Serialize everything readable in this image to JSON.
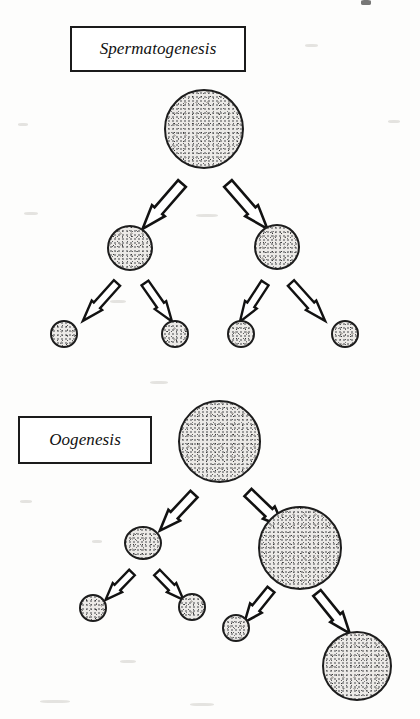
{
  "figure": {
    "background_color": "#fdfdfc",
    "ink_color": "#1d1d1d",
    "cell_fill_color": "#eceae7"
  },
  "panels": [
    {
      "id": "spermatogenesis",
      "label": "Spermatogenesis",
      "label_box": {
        "x": 70,
        "y": 26,
        "width": 176,
        "height": 46
      },
      "cells": [
        {
          "name": "primary-spermatocyte",
          "cx": 204,
          "cy": 129,
          "d": 80,
          "level": 0
        },
        {
          "name": "secondary-spermatocyte-left",
          "cx": 130,
          "cy": 248,
          "d": 46,
          "level": 1
        },
        {
          "name": "secondary-spermatocyte-right",
          "cx": 277,
          "cy": 247,
          "d": 46,
          "level": 1
        },
        {
          "name": "spermatid-1",
          "cx": 64,
          "cy": 334,
          "d": 28,
          "level": 2
        },
        {
          "name": "spermatid-2",
          "cx": 175,
          "cy": 334,
          "d": 28,
          "level": 2
        },
        {
          "name": "spermatid-3",
          "cx": 241,
          "cy": 334,
          "d": 28,
          "level": 2
        },
        {
          "name": "spermatid-4",
          "cx": 345,
          "cy": 334,
          "d": 28,
          "level": 2
        }
      ],
      "arrows": [
        {
          "name": "arrow-meiosis1-left",
          "x1": 182,
          "y1": 175,
          "x2": 143,
          "y2": 220,
          "w": 17
        },
        {
          "name": "arrow-meiosis1-right",
          "x1": 228,
          "y1": 175,
          "x2": 266,
          "y2": 220,
          "w": 17
        },
        {
          "name": "arrow-meiosis2-a",
          "x1": 117,
          "y1": 276,
          "x2": 83,
          "y2": 314,
          "w": 14
        },
        {
          "name": "arrow-meiosis2-b",
          "x1": 145,
          "y1": 276,
          "x2": 172,
          "y2": 314,
          "w": 14
        },
        {
          "name": "arrow-meiosis2-c",
          "x1": 265,
          "y1": 276,
          "x2": 240,
          "y2": 314,
          "w": 14
        },
        {
          "name": "arrow-meiosis2-d",
          "x1": 291,
          "y1": 276,
          "x2": 325,
          "y2": 314,
          "w": 14
        }
      ]
    },
    {
      "id": "oogenesis",
      "label": "Oogenesis",
      "label_box": {
        "x": 18,
        "y": 416,
        "width": 134,
        "height": 48
      },
      "cells": [
        {
          "name": "primary-oocyte",
          "cx": 220,
          "cy": 441,
          "d": 83,
          "level": 0
        },
        {
          "name": "first-polar-body",
          "cx": 143,
          "cy": 544,
          "d": 38,
          "level": 1
        },
        {
          "name": "secondary-oocyte",
          "cx": 300,
          "cy": 548,
          "d": 84,
          "level": 1
        },
        {
          "name": "polar-body-a",
          "cx": 93,
          "cy": 608,
          "d": 28,
          "level": 2
        },
        {
          "name": "polar-body-b",
          "cx": 192,
          "cy": 607,
          "d": 28,
          "level": 2
        },
        {
          "name": "polar-body-c",
          "cx": 236,
          "cy": 628,
          "d": 28,
          "level": 2
        },
        {
          "name": "ovum",
          "cx": 357,
          "cy": 666,
          "d": 70,
          "level": 2
        }
      ],
      "arrows": [
        {
          "name": "arrow-oo-meiosis1-left",
          "x1": 194,
          "y1": 486,
          "x2": 161,
          "y2": 522,
          "w": 16
        },
        {
          "name": "arrow-oo-meiosis1-right",
          "x1": 248,
          "y1": 484,
          "x2": 282,
          "y2": 516,
          "w": 17
        },
        {
          "name": "arrow-oo-polar-a",
          "x1": 132,
          "y1": 566,
          "x2": 107,
          "y2": 592,
          "w": 13
        },
        {
          "name": "arrow-oo-polar-b",
          "x1": 157,
          "y1": 566,
          "x2": 182,
          "y2": 592,
          "w": 13
        },
        {
          "name": "arrow-oo-meiosis2-left",
          "x1": 271,
          "y1": 582,
          "x2": 247,
          "y2": 612,
          "w": 15
        },
        {
          "name": "arrow-oo-meiosis2-right",
          "x1": 317,
          "y1": 585,
          "x2": 349,
          "y2": 625,
          "w": 16
        }
      ]
    }
  ]
}
